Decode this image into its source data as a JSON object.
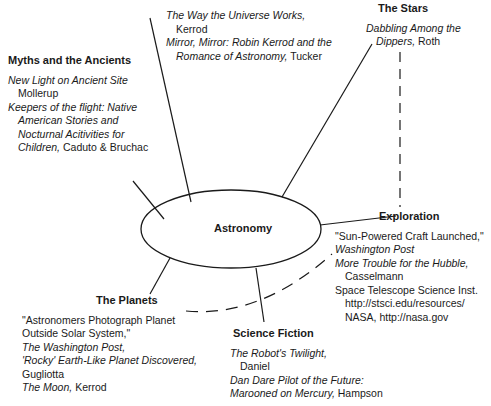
{
  "center": {
    "label": "Astronomy"
  },
  "nodes": {
    "top": {
      "heading": "",
      "entries": [
        {
          "title": "The Way the Universe Works,",
          "author": "Kerrod"
        },
        {
          "title_l1": "Mirror, Mirror: Robin Kerrod and the",
          "title_l2": "Romance of Astronomy,",
          "author": "Tucker"
        }
      ]
    },
    "myths": {
      "heading": "Myths and the Ancients",
      "entries": [
        {
          "title": "New Light on Ancient Site",
          "author": "Mollerup"
        },
        {
          "title_l1": "Keepers of the flight: Native",
          "title_l2": "American Stories and",
          "title_l3": "Nocturnal Acitivities for",
          "title_l4": "Children,",
          "author": "Caduto & Bruchac"
        }
      ]
    },
    "stars": {
      "heading": "The Stars",
      "entries": [
        {
          "title_l1": "Dabbling Among the",
          "title_l2": "Dippers,",
          "author": "Roth"
        }
      ]
    },
    "exploration": {
      "heading": "Exploration",
      "entries": [
        {
          "title": "\"Sun-Powered Craft Launched,\"",
          "source": "Washington Post"
        },
        {
          "title": "More Trouble for the Hubble,",
          "author": "Casselmann"
        },
        {
          "title": "Space Telescope Science Inst.",
          "url": "http://stsci.edu/resources/"
        },
        {
          "title": "NASA, http://nasa.gov"
        }
      ]
    },
    "planets": {
      "heading": "The Planets",
      "entries": [
        {
          "title_l1": "\"Astronomers Photograph Planet",
          "title_l2": "Outside Solar System,\"",
          "source": "The Washington Post,"
        },
        {
          "title": "'Rocky' Earth-Like Planet Discovered,",
          "author": "Gugliotta"
        },
        {
          "title": "The Moon,",
          "author": "Kerrod"
        }
      ]
    },
    "scifi": {
      "heading": "Science Fiction",
      "entries": [
        {
          "title": "The Robot's Twilight,",
          "author": "Daniel"
        },
        {
          "title_l1": "Dan Dare Pilot of the Future:",
          "title_l2": "Marooned on Mercury,",
          "author": "Hampson"
        }
      ]
    }
  }
}
